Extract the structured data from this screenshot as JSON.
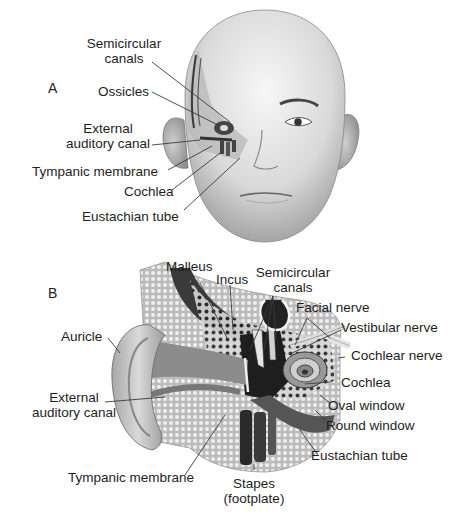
{
  "figure": {
    "panels": [
      {
        "id": "A",
        "letter": "A",
        "subject": "frontal view of head with cut-away of left ear",
        "labels": [
          {
            "key": "semicircular_canals",
            "line1": "Semicircular",
            "line2": "canals"
          },
          {
            "key": "ossicles",
            "line1": "Ossicles"
          },
          {
            "key": "external_auditory_canal",
            "line1": "External",
            "line2": "auditory canal"
          },
          {
            "key": "tympanic_membrane",
            "line1": "Tympanic membrane"
          },
          {
            "key": "cochlea",
            "line1": "Cochlea"
          },
          {
            "key": "eustachian_tube",
            "line1": "Eustachian tube"
          }
        ]
      },
      {
        "id": "B",
        "letter": "B",
        "subject": "coronal cross-section of outer, middle and inner ear",
        "labels": [
          {
            "key": "malleus",
            "line1": "Malleus"
          },
          {
            "key": "incus",
            "line1": "Incus"
          },
          {
            "key": "semicircular_canals",
            "line1": "Semicircular",
            "line2": "canals"
          },
          {
            "key": "facial_nerve",
            "line1": "Facial nerve"
          },
          {
            "key": "vestibular_nerve",
            "line1": "Vestibular nerve"
          },
          {
            "key": "cochlear_nerve",
            "line1": "Cochlear nerve"
          },
          {
            "key": "auricle",
            "line1": "Auricle"
          },
          {
            "key": "cochlea",
            "line1": "Cochlea"
          },
          {
            "key": "external_auditory_canal",
            "line1": "External",
            "line2": "auditory canal"
          },
          {
            "key": "oval_window",
            "line1": "Oval window"
          },
          {
            "key": "round_window",
            "line1": "Round window"
          },
          {
            "key": "eustachian_tube",
            "line1": "Eustachian tube"
          },
          {
            "key": "tympanic_membrane",
            "line1": "Tympanic membrane"
          },
          {
            "key": "stapes",
            "line1": "Stapes",
            "line2": "(footplate)"
          }
        ]
      }
    ]
  },
  "colors": {
    "background": "#ffffff",
    "text": "#1e1e1e",
    "leader_line": "#3a3a3a",
    "skin_light": "#e6e6e6",
    "skin_mid": "#bdbdbd",
    "bone_dark": "#2a2a2a"
  }
}
